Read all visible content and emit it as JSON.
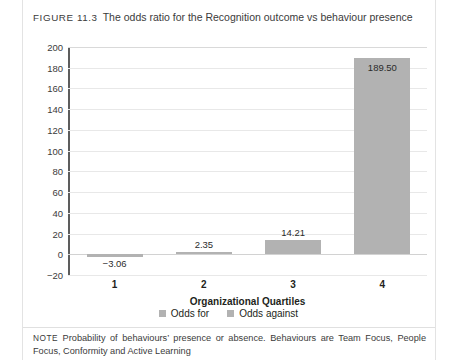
{
  "figure": {
    "label": "FIGURE 11.3",
    "caption": "The odds ratio for the Recognition outcome vs behaviour presence"
  },
  "note": {
    "label": "NOTE",
    "text": "Probability of behaviours’ presence or absence. Behaviours are Team Focus, People Focus, Conformity and Active Learning"
  },
  "legend": {
    "items": [
      {
        "label": "Odds for",
        "color": "#b2b2b2"
      },
      {
        "label": "Odds against",
        "color": "#b2b2b2"
      }
    ]
  },
  "chart_data": {
    "type": "bar",
    "title": "The odds ratio for the Recognition outcome vs behaviour presence",
    "xlabel": "Organizational Quartiles",
    "ylabel": "",
    "categories": [
      "1",
      "2",
      "3",
      "4"
    ],
    "values": [
      -3.06,
      2.35,
      14.21,
      189.5
    ],
    "data_labels": [
      "−3.06",
      "2.35",
      "14.21",
      "189.50"
    ],
    "series": [
      {
        "name": "Odds for",
        "values": [
          -3.06,
          2.35,
          14.21,
          189.5
        ]
      }
    ],
    "ylim": [
      -20,
      200
    ],
    "ytick_step": 20,
    "yticks": [
      "200",
      "180",
      "160",
      "140",
      "120",
      "100",
      "80",
      "60",
      "40",
      "20",
      "0",
      "−20"
    ],
    "grid": true,
    "legend_position": "bottom",
    "bar_color": "#b2b2b2"
  }
}
